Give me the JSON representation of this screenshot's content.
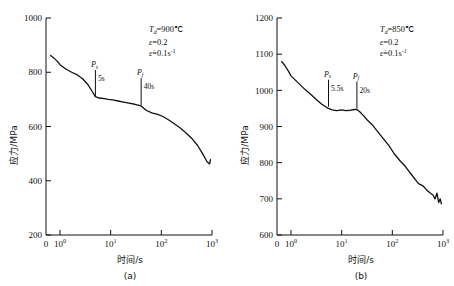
{
  "figure": {
    "panels": [
      {
        "id": "a",
        "caption": "(a)",
        "xlabel": "时间/s",
        "ylabel": "应力/MPa",
        "conditions": {
          "temp_symbol": "T",
          "temp_sub": "d",
          "temp_value": "=900℃",
          "strain_symbol": "ε",
          "strain_value": "=0.2",
          "rate_symbol": "ε̇",
          "rate_value": "=0.1s",
          "rate_sup": "-1"
        },
        "markers": [
          {
            "label": "P",
            "sub": "s",
            "time": "5s"
          },
          {
            "label": "P",
            "sub": "f",
            "time": "40s"
          }
        ],
        "y_ticks": [
          "200",
          "400",
          "600",
          "800",
          "1000"
        ],
        "x_ticks": [
          "0",
          "10",
          "10",
          "10",
          "10"
        ],
        "x_exponents": [
          "",
          "0",
          "1",
          "2",
          "3"
        ]
      },
      {
        "id": "b",
        "caption": "(b)",
        "xlabel": "时间/s",
        "ylabel": "应力/MPa",
        "conditions": {
          "temp_symbol": "T",
          "temp_sub": "d",
          "temp_value": "=850℃",
          "strain_symbol": "ε",
          "strain_value": "=0.2",
          "rate_symbol": "ε̇",
          "rate_value": "=0.1s",
          "rate_sup": "-1"
        },
        "markers": [
          {
            "label": "P",
            "sub": "s",
            "time": "5.5s"
          },
          {
            "label": "P",
            "sub": "f",
            "time": "20s"
          }
        ],
        "y_ticks": [
          "600",
          "700",
          "800",
          "900",
          "1000",
          "1100",
          "1200"
        ],
        "x_ticks": [
          "0",
          "10",
          "10",
          "10",
          "10"
        ],
        "x_exponents": [
          "",
          "0",
          "1",
          "2",
          "3"
        ]
      }
    ]
  },
  "chart_data": [
    {
      "type": "line",
      "panel": "a",
      "title": "",
      "xlabel": "时间/s",
      "ylabel": "应力/MPa",
      "xscale": "log",
      "xlim": [
        0.4,
        1000
      ],
      "ylim": [
        200,
        1000
      ],
      "ytick_values": [
        200,
        400,
        600,
        800,
        1000
      ],
      "xtick_values": [
        1,
        10,
        100,
        1000
      ],
      "xtick_labels": [
        "10^0",
        "10^1",
        "10^2",
        "10^3"
      ],
      "grid": false,
      "legend": null,
      "annotations": [
        {
          "text": "T_d=900℃",
          "type": "condition"
        },
        {
          "text": "ε=0.2",
          "type": "condition"
        },
        {
          "text": "ε̇=0.1s^-1",
          "type": "condition"
        },
        {
          "text": "P_s",
          "time_s": 5,
          "stress_MPa": 705,
          "label": "5s"
        },
        {
          "text": "P_f",
          "time_s": 40,
          "stress_MPa": 675,
          "label": "40s"
        }
      ],
      "x": [
        0.45,
        0.6,
        0.8,
        1.0,
        1.3,
        1.7,
        2.2,
        2.8,
        3.5,
        4.3,
        5.0,
        6.0,
        7.5,
        9.0,
        11,
        14,
        18,
        23,
        30,
        40,
        50,
        65,
        85,
        110,
        140,
        180,
        230,
        300,
        400,
        520,
        650,
        800,
        900,
        930
      ],
      "y": [
        862,
        852,
        840,
        828,
        812,
        800,
        790,
        776,
        756,
        730,
        710,
        705,
        703,
        700,
        698,
        694,
        690,
        686,
        682,
        676,
        660,
        650,
        645,
        636,
        624,
        610,
        596,
        578,
        556,
        530,
        500,
        470,
        462,
        478
      ],
      "series_name": "flow stress"
    },
    {
      "type": "line",
      "panel": "b",
      "title": "",
      "xlabel": "时间/s",
      "ylabel": "应力/MPa",
      "xscale": "log",
      "xlim": [
        0.4,
        1000
      ],
      "ylim": [
        600,
        1200
      ],
      "ytick_values": [
        600,
        700,
        800,
        900,
        1000,
        1100,
        1200
      ],
      "xtick_values": [
        1,
        10,
        100,
        1000
      ],
      "xtick_labels": [
        "10^0",
        "10^1",
        "10^2",
        "10^3"
      ],
      "grid": false,
      "legend": null,
      "annotations": [
        {
          "text": "T_d=850℃",
          "type": "condition"
        },
        {
          "text": "ε=0.2",
          "type": "condition"
        },
        {
          "text": "ε̇=0.1s^-1",
          "type": "condition"
        },
        {
          "text": "P_s",
          "time_s": 5.5,
          "stress_MPa": 952,
          "label": "5.5s"
        },
        {
          "text": "P_f",
          "time_s": 20,
          "stress_MPa": 947,
          "label": "20s"
        }
      ],
      "x": [
        0.45,
        0.6,
        0.8,
        1.0,
        1.4,
        1.9,
        2.5,
        3.2,
        4.0,
        5.0,
        5.5,
        6.5,
        8,
        10,
        12,
        15,
        18,
        20,
        23,
        27,
        32,
        40,
        50,
        65,
        85,
        110,
        140,
        180,
        230,
        290,
        330,
        400,
        480,
        560,
        640,
        700,
        760,
        820,
        880,
        930
      ],
      "y": [
        1080,
        1068,
        1053,
        1040,
        1020,
        1002,
        988,
        974,
        962,
        953,
        950,
        946,
        944,
        946,
        944,
        945,
        947,
        947,
        940,
        930,
        918,
        905,
        888,
        868,
        848,
        824,
        806,
        790,
        770,
        752,
        742,
        736,
        724,
        716,
        710,
        700,
        716,
        690,
        700,
        686
      ],
      "series_name": "flow stress"
    }
  ]
}
